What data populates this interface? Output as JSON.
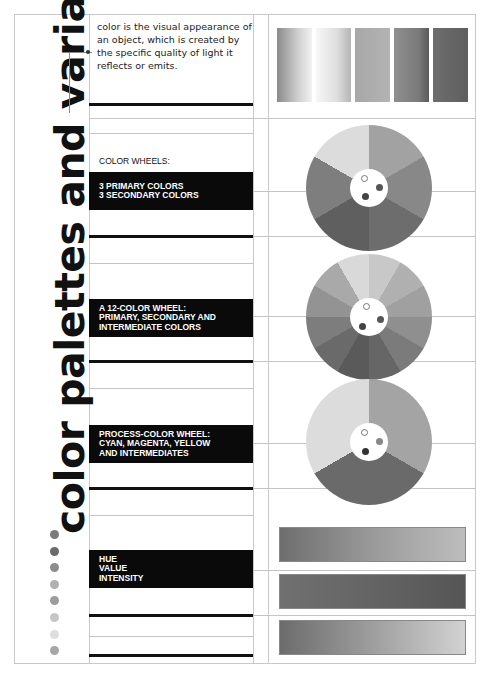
{
  "page": {
    "title": "color palettes and variations",
    "intro_text": "color is the visual appearance of an object, which is created by the specific quality of light it reflects or emits."
  },
  "sections": [
    {
      "id": "color-wheels-heading",
      "text": "COLOR WHEELS:",
      "style": "plain"
    },
    {
      "id": "primary-secondary",
      "lines": [
        "3 PRIMARY COLORS",
        "3 SECONDARY COLORS"
      ],
      "style": "dark"
    },
    {
      "id": "twelve-color",
      "lines": [
        "A 12-COLOR WHEEL:",
        "PRIMARY, SECONDARY AND",
        "INTERMEDIATE COLORS"
      ],
      "style": "dark"
    },
    {
      "id": "process-color",
      "lines": [
        "PROCESS-COLOR WHEEL:",
        "CYAN, MAGENTA, YELLOW",
        "AND INTERMEDIATES"
      ],
      "style": "dark"
    },
    {
      "id": "hue-value-intensity",
      "lines": [
        "HUE",
        "VALUE",
        "INTENSITY"
      ],
      "style": "dark"
    }
  ],
  "swatches": [
    {
      "gradient": "linear-gradient(90deg,#8a8a8a,#cfcfcf 60%,#f2f2f2)"
    },
    {
      "gradient": "linear-gradient(90deg,#f7f7f7,#dedede 60%,#b5b5b5)"
    },
    {
      "gradient": "linear-gradient(90deg,#a8a8a8,#b3b3b3)"
    },
    {
      "gradient": "linear-gradient(90deg,#8f8f8f,#7a7a7a 70%,#5a5a5a)"
    },
    {
      "gradient": "linear-gradient(90deg,#6e6e6e,#5e5e5e)"
    }
  ],
  "wheels": [
    {
      "name": "six-color-wheel",
      "segments": 6,
      "colors": [
        "#a2a2a2",
        "#888",
        "#6d6d6d",
        "#5f5f5f",
        "#7e7e7e",
        "#dcdcdc"
      ]
    },
    {
      "name": "twelve-color-wheel",
      "segments": 12,
      "colors": [
        "#c8c8c8",
        "#b0b0b0",
        "#a0a0a0",
        "#8f8f8f",
        "#7b7b7b",
        "#666",
        "#5a5a5a",
        "#6a6a6a",
        "#7d7d7d",
        "#939393",
        "#a9a9a9",
        "#d9d9d9"
      ]
    },
    {
      "name": "process-color-wheel",
      "segments": 3,
      "colors": [
        "#a4a4a4",
        "#6a6a6a",
        "#dcdcdc"
      ]
    }
  ],
  "bars": [
    {
      "name": "hue-bar",
      "gradient": "linear-gradient(90deg,#6e6e6e,#9a9a9a 50%,#bdbdbd)"
    },
    {
      "name": "value-bar",
      "gradient": "linear-gradient(90deg,#707070,#646464 50%,#555)"
    },
    {
      "name": "intensity-bar",
      "gradient": "linear-gradient(90deg,#6c6c6c,#9e9e9e 50%,#d2d2d2)"
    }
  ],
  "dots": [
    "#7a7a7a",
    "#6a6a6a",
    "#8c8c8c",
    "#b0b0b0",
    "#9c9c9c",
    "#c6c6c6",
    "#dedede",
    "#a6a6a6"
  ]
}
